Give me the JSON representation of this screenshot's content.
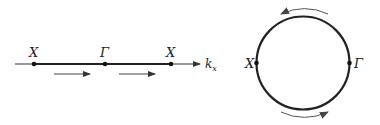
{
  "left_diagram": {
    "axis_label": "k",
    "axis_subscript": "x",
    "points": [
      {
        "label": "X",
        "x": 34
      },
      {
        "label": "Γ",
        "x": 105
      },
      {
        "label": "X",
        "x": 171
      }
    ],
    "arrows": [
      "right",
      "right"
    ]
  },
  "right_diagram": {
    "left_point": "X",
    "right_point": "Γ",
    "arrows": [
      "top counter-clockwise",
      "bottom counter-clockwise"
    ]
  },
  "colors": {
    "line": "#222222",
    "arrow": "#555555"
  }
}
